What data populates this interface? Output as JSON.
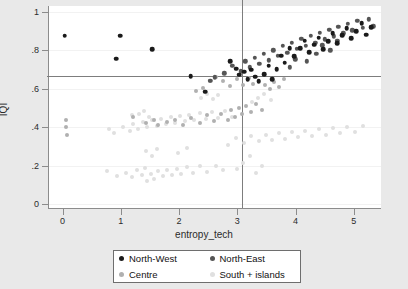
{
  "chart_data": {
    "type": "scatter",
    "title": "",
    "xlabel": "entropy_tech",
    "ylabel": "IQI",
    "xlim": [
      -0.25,
      5.45
    ],
    "ylim": [
      -0.02,
      1.03
    ],
    "xticks": [
      0,
      1,
      2,
      3,
      4,
      5
    ],
    "xticklabels": [
      "0",
      "1",
      "2",
      "3",
      "4",
      "5"
    ],
    "yticks": [
      0,
      0.2,
      0.4,
      0.6,
      0.8,
      1
    ],
    "yticklabels": [
      "0",
      ".2",
      ".4",
      ".6",
      ".8",
      "1"
    ],
    "grid": true,
    "grid_axis": "y",
    "legend_position": "below-center",
    "reference_lines": [
      {
        "orientation": "horizontal",
        "value": 0.665,
        "axis": "IQI"
      },
      {
        "orientation": "vertical",
        "value": 3.07,
        "axis": "entropy_tech"
      }
    ],
    "series": [
      {
        "name": "North-West",
        "color": "#1a1a1a",
        "marker": "circle",
        "points": [
          [
            0.02,
            0.875
          ],
          [
            0.97,
            0.875
          ],
          [
            1.52,
            0.805
          ],
          [
            0.9,
            0.755
          ],
          [
            2.18,
            0.665
          ],
          [
            2.43,
            0.585
          ],
          [
            2.96,
            0.705
          ],
          [
            3.02,
            0.672
          ],
          [
            3.1,
            0.688
          ],
          [
            3.16,
            0.648
          ],
          [
            3.22,
            0.698
          ],
          [
            3.29,
            0.662
          ],
          [
            2.86,
            0.742
          ],
          [
            3.35,
            0.638
          ],
          [
            3.44,
            0.675
          ],
          [
            3.52,
            0.72
          ],
          [
            3.58,
            0.648
          ],
          [
            3.66,
            0.7
          ],
          [
            3.74,
            0.772
          ],
          [
            3.8,
            0.735
          ],
          [
            3.88,
            0.812
          ],
          [
            3.96,
            0.768
          ],
          [
            4.06,
            0.812
          ],
          [
            4.14,
            0.85
          ],
          [
            4.22,
            0.79
          ],
          [
            4.3,
            0.828
          ],
          [
            4.38,
            0.866
          ],
          [
            4.46,
            0.806
          ],
          [
            4.54,
            0.848
          ],
          [
            4.62,
            0.888
          ],
          [
            4.7,
            0.836
          ],
          [
            4.78,
            0.878
          ],
          [
            4.86,
            0.915
          ],
          [
            4.94,
            0.862
          ],
          [
            5.02,
            0.9
          ],
          [
            5.12,
            0.942
          ],
          [
            5.2,
            0.88
          ],
          [
            5.28,
            0.92
          ]
        ]
      },
      {
        "name": "North-East",
        "color": "#555555",
        "marker": "circle",
        "points": [
          [
            2.76,
            0.68
          ],
          [
            2.9,
            0.718
          ],
          [
            3.04,
            0.69
          ],
          [
            3.12,
            0.742
          ],
          [
            3.2,
            0.712
          ],
          [
            3.28,
            0.762
          ],
          [
            3.36,
            0.728
          ],
          [
            3.44,
            0.782
          ],
          [
            3.52,
            0.748
          ],
          [
            3.6,
            0.8
          ],
          [
            3.68,
            0.77
          ],
          [
            3.76,
            0.822
          ],
          [
            3.84,
            0.788
          ],
          [
            3.92,
            0.84
          ],
          [
            4.0,
            0.806
          ],
          [
            4.08,
            0.858
          ],
          [
            4.16,
            0.822
          ],
          [
            4.24,
            0.874
          ],
          [
            4.32,
            0.84
          ],
          [
            4.4,
            0.89
          ],
          [
            4.48,
            0.856
          ],
          [
            4.56,
            0.906
          ],
          [
            4.64,
            0.872
          ],
          [
            4.72,
            0.922
          ],
          [
            4.8,
            0.888
          ],
          [
            4.88,
            0.938
          ],
          [
            4.96,
            0.904
          ],
          [
            5.04,
            0.952
          ],
          [
            5.14,
            0.918
          ],
          [
            5.24,
            0.96
          ],
          [
            5.32,
            0.925
          ],
          [
            2.6,
            0.66
          ],
          [
            2.52,
            0.642
          ],
          [
            3.98,
            0.752
          ],
          [
            4.34,
            0.782
          ],
          [
            4.58,
            0.8
          ],
          [
            4.18,
            0.742
          ],
          [
            3.88,
            0.712
          ],
          [
            4.44,
            0.826
          ],
          [
            4.7,
            0.848
          ]
        ]
      },
      {
        "name": "Centre",
        "color": "#b0b0b0",
        "marker": "circle",
        "points": [
          [
            0.04,
            0.4
          ],
          [
            0.05,
            0.44
          ],
          [
            0.06,
            0.362
          ],
          [
            1.2,
            0.452
          ],
          [
            1.42,
            0.42
          ],
          [
            1.55,
            0.436
          ],
          [
            1.62,
            0.412
          ],
          [
            1.78,
            0.428
          ],
          [
            1.92,
            0.44
          ],
          [
            2.05,
            0.41
          ],
          [
            2.18,
            0.448
          ],
          [
            2.34,
            0.42
          ],
          [
            2.46,
            0.462
          ],
          [
            2.58,
            0.432
          ],
          [
            2.7,
            0.47
          ],
          [
            2.82,
            0.44
          ],
          [
            2.88,
            0.488
          ],
          [
            2.94,
            0.452
          ],
          [
            3.02,
            0.5
          ],
          [
            3.06,
            0.47
          ],
          [
            3.14,
            0.512
          ],
          [
            3.22,
            0.48
          ],
          [
            3.3,
            0.522
          ],
          [
            3.4,
            0.492
          ],
          [
            2.74,
            0.64
          ],
          [
            2.86,
            0.612
          ],
          [
            2.98,
            0.648
          ],
          [
            3.08,
            0.618
          ],
          [
            3.18,
            0.658
          ],
          [
            3.26,
            0.626
          ],
          [
            2.62,
            0.662
          ],
          [
            2.52,
            0.638
          ],
          [
            3.46,
            0.62
          ],
          [
            3.54,
            0.596
          ],
          [
            3.62,
            0.634
          ],
          [
            3.7,
            0.61
          ],
          [
            3.78,
            0.648
          ],
          [
            2.4,
            0.602
          ],
          [
            2.28,
            0.588
          ]
        ]
      },
      {
        "name": "South + islands",
        "color": "#e0e0e0",
        "marker": "circle",
        "points": [
          [
            0.78,
            0.392
          ],
          [
            0.86,
            0.37
          ],
          [
            1.02,
            0.402
          ],
          [
            1.14,
            0.38
          ],
          [
            1.2,
            0.418
          ],
          [
            1.28,
            0.392
          ],
          [
            1.36,
            0.428
          ],
          [
            1.44,
            0.4
          ],
          [
            1.52,
            0.438
          ],
          [
            1.6,
            0.408
          ],
          [
            1.68,
            0.444
          ],
          [
            1.76,
            0.416
          ],
          [
            1.84,
            0.452
          ],
          [
            1.92,
            0.422
          ],
          [
            2.0,
            0.458
          ],
          [
            2.08,
            0.43
          ],
          [
            2.16,
            0.466
          ],
          [
            2.24,
            0.436
          ],
          [
            2.34,
            0.472
          ],
          [
            2.44,
            0.442
          ],
          [
            2.54,
            0.478
          ],
          [
            2.66,
            0.448
          ],
          [
            2.78,
            0.484
          ],
          [
            2.9,
            0.452
          ],
          [
            1.18,
            0.462
          ],
          [
            1.3,
            0.47
          ],
          [
            1.38,
            0.486
          ],
          [
            1.46,
            0.452
          ],
          [
            0.74,
            0.172
          ],
          [
            0.92,
            0.148
          ],
          [
            1.08,
            0.162
          ],
          [
            1.18,
            0.14
          ],
          [
            1.26,
            0.175
          ],
          [
            1.34,
            0.152
          ],
          [
            1.4,
            0.188
          ],
          [
            1.44,
            0.118
          ],
          [
            1.5,
            0.158
          ],
          [
            1.56,
            0.132
          ],
          [
            1.62,
            0.172
          ],
          [
            1.7,
            0.145
          ],
          [
            1.78,
            0.178
          ],
          [
            1.86,
            0.152
          ],
          [
            1.94,
            0.185
          ],
          [
            2.02,
            0.158
          ],
          [
            2.12,
            0.192
          ],
          [
            2.22,
            0.162
          ],
          [
            2.34,
            0.196
          ],
          [
            2.46,
            0.168
          ],
          [
            1.42,
            0.278
          ],
          [
            1.52,
            0.252
          ],
          [
            1.6,
            0.288
          ],
          [
            1.96,
            0.268
          ],
          [
            2.12,
            0.292
          ],
          [
            2.62,
            0.198
          ],
          [
            2.74,
            0.175
          ],
          [
            3.08,
            0.212
          ],
          [
            2.98,
            0.185
          ],
          [
            3.2,
            0.248
          ],
          [
            3.3,
            0.16
          ],
          [
            3.4,
            0.196
          ],
          [
            2.82,
            0.31
          ],
          [
            2.96,
            0.342
          ],
          [
            3.1,
            0.318
          ],
          [
            3.22,
            0.352
          ],
          [
            3.36,
            0.328
          ],
          [
            3.48,
            0.362
          ],
          [
            3.58,
            0.332
          ],
          [
            3.7,
            0.368
          ],
          [
            3.8,
            0.34
          ],
          [
            3.92,
            0.375
          ],
          [
            4.02,
            0.348
          ],
          [
            4.14,
            0.382
          ],
          [
            4.26,
            0.356
          ],
          [
            4.38,
            0.39
          ],
          [
            4.5,
            0.362
          ],
          [
            4.62,
            0.396
          ],
          [
            4.74,
            0.368
          ],
          [
            4.86,
            0.402
          ],
          [
            5.0,
            0.375
          ],
          [
            5.14,
            0.408
          ],
          [
            3.24,
            0.532
          ],
          [
            3.34,
            0.552
          ],
          [
            3.44,
            0.572
          ],
          [
            3.56,
            0.542
          ],
          [
            2.66,
            0.568
          ],
          [
            2.56,
            0.548
          ],
          [
            2.46,
            0.572
          ],
          [
            2.36,
            0.552
          ]
        ]
      }
    ]
  },
  "axes": {
    "x_title": "entropy_tech",
    "y_title": "IQI",
    "x_ticklabels": [
      "0",
      "1",
      "2",
      "3",
      "4",
      "5"
    ],
    "y_ticklabels": [
      "1",
      ".8",
      ".6",
      ".4",
      ".2",
      "0"
    ]
  },
  "legend": {
    "entries": [
      {
        "label": "North-West",
        "color": "#1a1a1a"
      },
      {
        "label": "North-East",
        "color": "#555555"
      },
      {
        "label": "Centre",
        "color": "#b0b0b0"
      },
      {
        "label": "South + islands",
        "color": "#e0e0e0"
      }
    ]
  },
  "colors": {
    "figure_background": "#e9e9e9",
    "panel_background": "#ffffff",
    "axis": "#8c8c8c",
    "reference_line": "#7d7d7d",
    "gridline": "#f2f2f2"
  }
}
